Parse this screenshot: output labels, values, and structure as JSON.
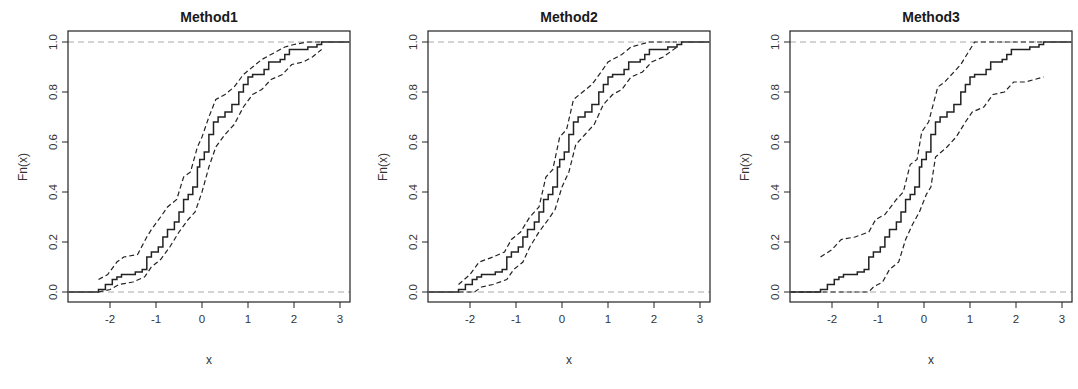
{
  "chart_data": [
    {
      "type": "line",
      "title": "Method1",
      "xlabel": "x",
      "ylabel": "Fn(x)",
      "xlim": [
        -2.9,
        3.2
      ],
      "ylim": [
        -0.04,
        1.04
      ],
      "xticks": [
        -2,
        -1,
        0,
        1,
        2,
        3
      ],
      "yticks": [
        "0.0",
        "0.2",
        "0.4",
        "0.6",
        "0.8",
        "1.0"
      ],
      "reference_lines": [
        0,
        1
      ],
      "series": [
        {
          "name": "ECDF",
          "style": "solid-step",
          "x": [
            -2.9,
            -2.25,
            -2.1,
            -1.95,
            -1.85,
            -1.75,
            -1.45,
            -1.3,
            -1.2,
            -1.1,
            -0.95,
            -0.85,
            -0.75,
            -0.6,
            -0.5,
            -0.4,
            -0.3,
            -0.2,
            -0.1,
            -0.05,
            0.05,
            0.15,
            0.25,
            0.35,
            0.5,
            0.65,
            0.8,
            0.9,
            1.0,
            1.1,
            1.35,
            1.45,
            1.7,
            1.8,
            1.9,
            2.3,
            2.5,
            2.6,
            3.2
          ],
          "y": [
            0.0,
            0.01,
            0.03,
            0.05,
            0.06,
            0.07,
            0.08,
            0.09,
            0.14,
            0.16,
            0.18,
            0.22,
            0.25,
            0.28,
            0.32,
            0.37,
            0.39,
            0.42,
            0.5,
            0.53,
            0.56,
            0.63,
            0.68,
            0.7,
            0.72,
            0.75,
            0.8,
            0.83,
            0.86,
            0.87,
            0.89,
            0.92,
            0.93,
            0.95,
            0.97,
            0.98,
            0.99,
            1.0,
            1.0
          ]
        },
        {
          "name": "Upper band",
          "style": "dashed",
          "x": [
            -2.25,
            -2.05,
            -1.85,
            -1.7,
            -1.4,
            -1.2,
            -1.1,
            -0.9,
            -0.75,
            -0.55,
            -0.4,
            -0.25,
            -0.1,
            0.0,
            0.15,
            0.3,
            0.5,
            0.7,
            0.9,
            1.1,
            1.3,
            1.6,
            1.8,
            2.0,
            2.3,
            2.6
          ],
          "y": [
            0.05,
            0.07,
            0.12,
            0.14,
            0.15,
            0.22,
            0.25,
            0.3,
            0.34,
            0.37,
            0.46,
            0.48,
            0.58,
            0.62,
            0.7,
            0.77,
            0.79,
            0.82,
            0.87,
            0.9,
            0.93,
            0.96,
            0.98,
            0.99,
            1.0,
            1.0
          ]
        },
        {
          "name": "Lower band",
          "style": "dashed",
          "x": [
            -2.25,
            -2.0,
            -1.8,
            -1.5,
            -1.25,
            -1.1,
            -0.9,
            -0.7,
            -0.5,
            -0.3,
            -0.15,
            0.0,
            0.15,
            0.3,
            0.5,
            0.7,
            0.9,
            1.1,
            1.3,
            1.5,
            1.75,
            1.95,
            2.2,
            2.4,
            2.6
          ],
          "y": [
            0.0,
            0.01,
            0.03,
            0.04,
            0.06,
            0.1,
            0.13,
            0.18,
            0.24,
            0.29,
            0.32,
            0.4,
            0.5,
            0.58,
            0.63,
            0.67,
            0.74,
            0.79,
            0.81,
            0.85,
            0.87,
            0.91,
            0.92,
            0.94,
            0.97
          ]
        }
      ]
    },
    {
      "type": "line",
      "title": "Method2",
      "xlabel": "x",
      "ylabel": "Fn(x)",
      "xlim": [
        -2.9,
        3.2
      ],
      "ylim": [
        -0.04,
        1.04
      ],
      "xticks": [
        -2,
        -1,
        0,
        1,
        2,
        3
      ],
      "yticks": [
        "0.0",
        "0.2",
        "0.4",
        "0.6",
        "0.8",
        "1.0"
      ],
      "reference_lines": [
        0,
        1
      ],
      "series": [
        {
          "name": "ECDF",
          "style": "solid-step",
          "x": [
            -2.9,
            -2.25,
            -2.1,
            -1.95,
            -1.85,
            -1.75,
            -1.45,
            -1.3,
            -1.2,
            -1.1,
            -0.95,
            -0.85,
            -0.75,
            -0.6,
            -0.5,
            -0.4,
            -0.3,
            -0.2,
            -0.1,
            -0.05,
            0.05,
            0.15,
            0.25,
            0.35,
            0.5,
            0.65,
            0.8,
            0.9,
            1.0,
            1.1,
            1.35,
            1.45,
            1.7,
            1.8,
            1.9,
            2.3,
            2.5,
            2.6,
            3.2
          ],
          "y": [
            0.0,
            0.01,
            0.03,
            0.05,
            0.06,
            0.07,
            0.08,
            0.09,
            0.14,
            0.16,
            0.18,
            0.22,
            0.25,
            0.28,
            0.32,
            0.37,
            0.39,
            0.42,
            0.5,
            0.53,
            0.56,
            0.63,
            0.68,
            0.7,
            0.72,
            0.75,
            0.8,
            0.83,
            0.86,
            0.87,
            0.89,
            0.92,
            0.93,
            0.95,
            0.97,
            0.98,
            0.99,
            1.0,
            1.0
          ]
        },
        {
          "name": "Upper band",
          "style": "dashed",
          "x": [
            -2.25,
            -2.0,
            -1.8,
            -1.5,
            -1.25,
            -1.1,
            -0.9,
            -0.7,
            -0.5,
            -0.35,
            -0.2,
            -0.05,
            0.1,
            0.25,
            0.45,
            0.65,
            0.85,
            1.0,
            1.3,
            1.5,
            1.7,
            1.9,
            2.2,
            2.5
          ],
          "y": [
            0.03,
            0.07,
            0.12,
            0.14,
            0.16,
            0.21,
            0.24,
            0.3,
            0.34,
            0.46,
            0.49,
            0.62,
            0.65,
            0.77,
            0.8,
            0.83,
            0.88,
            0.92,
            0.95,
            0.98,
            0.99,
            1.0,
            1.0,
            1.0
          ]
        },
        {
          "name": "Lower band",
          "style": "dashed",
          "x": [
            -2.25,
            -1.9,
            -1.75,
            -1.5,
            -1.2,
            -1.05,
            -0.85,
            -0.7,
            -0.5,
            -0.3,
            -0.15,
            0.0,
            0.15,
            0.3,
            0.5,
            0.7,
            0.9,
            1.1,
            1.3,
            1.5,
            1.75,
            1.95,
            2.2,
            2.5
          ],
          "y": [
            0.0,
            0.0,
            0.02,
            0.03,
            0.05,
            0.09,
            0.12,
            0.18,
            0.24,
            0.29,
            0.33,
            0.42,
            0.48,
            0.59,
            0.63,
            0.67,
            0.75,
            0.79,
            0.81,
            0.86,
            0.88,
            0.92,
            0.94,
            0.98
          ]
        }
      ]
    },
    {
      "type": "line",
      "title": "Method3",
      "xlabel": "x",
      "ylabel": "Fn(x)",
      "xlim": [
        -2.9,
        3.2
      ],
      "ylim": [
        -0.04,
        1.04
      ],
      "xticks": [
        -2,
        -1,
        0,
        1,
        2,
        3
      ],
      "yticks": [
        "0.0",
        "0.2",
        "0.4",
        "0.6",
        "0.8",
        "1.0"
      ],
      "reference_lines": [
        0,
        1
      ],
      "series": [
        {
          "name": "ECDF",
          "style": "solid-step",
          "x": [
            -2.9,
            -2.25,
            -2.1,
            -1.95,
            -1.85,
            -1.75,
            -1.45,
            -1.3,
            -1.2,
            -1.1,
            -0.95,
            -0.85,
            -0.75,
            -0.6,
            -0.5,
            -0.4,
            -0.3,
            -0.2,
            -0.1,
            -0.05,
            0.05,
            0.15,
            0.25,
            0.35,
            0.5,
            0.65,
            0.8,
            0.9,
            1.0,
            1.1,
            1.35,
            1.45,
            1.7,
            1.8,
            1.9,
            2.3,
            2.5,
            2.6,
            3.2
          ],
          "y": [
            0.0,
            0.01,
            0.03,
            0.05,
            0.06,
            0.07,
            0.08,
            0.09,
            0.14,
            0.16,
            0.18,
            0.22,
            0.25,
            0.28,
            0.32,
            0.37,
            0.39,
            0.42,
            0.5,
            0.53,
            0.56,
            0.63,
            0.68,
            0.7,
            0.72,
            0.75,
            0.8,
            0.83,
            0.86,
            0.87,
            0.89,
            0.92,
            0.93,
            0.95,
            0.97,
            0.98,
            0.99,
            1.0,
            1.0
          ]
        },
        {
          "name": "Upper band",
          "style": "dashed",
          "x": [
            -2.25,
            -2.0,
            -1.8,
            -1.5,
            -1.2,
            -1.05,
            -0.85,
            -0.6,
            -0.45,
            -0.3,
            -0.15,
            -0.05,
            0.1,
            0.3,
            0.45,
            0.65,
            0.8,
            1.0,
            1.1,
            2.6
          ],
          "y": [
            0.14,
            0.17,
            0.21,
            0.22,
            0.24,
            0.29,
            0.31,
            0.37,
            0.4,
            0.51,
            0.53,
            0.64,
            0.68,
            0.82,
            0.84,
            0.88,
            0.91,
            0.97,
            1.0,
            1.0
          ]
        },
        {
          "name": "Lower band",
          "style": "dashed",
          "x": [
            -2.9,
            -1.2,
            -1.1,
            -0.9,
            -0.75,
            -0.55,
            -0.4,
            -0.25,
            -0.1,
            0.05,
            0.15,
            0.25,
            0.5,
            0.7,
            0.9,
            1.05,
            1.3,
            1.5,
            1.75,
            1.95,
            2.2,
            2.6
          ],
          "y": [
            0.0,
            0.0,
            0.02,
            0.04,
            0.09,
            0.12,
            0.21,
            0.27,
            0.32,
            0.39,
            0.42,
            0.54,
            0.58,
            0.62,
            0.68,
            0.72,
            0.74,
            0.79,
            0.8,
            0.84,
            0.84,
            0.86
          ]
        }
      ]
    }
  ]
}
